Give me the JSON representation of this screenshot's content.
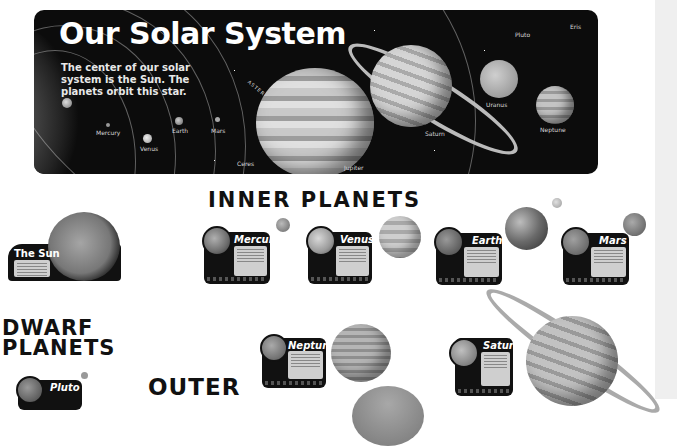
{
  "banner": {
    "title": "Our Solar System",
    "subtitle": "The center of our solar system is the Sun. The planets orbit this star.",
    "labels": {
      "mercury": "Mercury",
      "venus": "Venus",
      "earth": "Earth",
      "mars": "Mars",
      "asteroids": "ASTEROIDS",
      "ceres": "Ceres",
      "jupiter": "Jupiter",
      "saturn": "Saturn",
      "uranus": "Uranus",
      "neptune": "Neptune",
      "pluto": "Pluto",
      "eris": "Eris"
    }
  },
  "headings": {
    "inner": "INNER PLANETS",
    "dwarf_line1": "DWARF",
    "dwarf_line2": "PLANETS",
    "outer": "OUTER"
  },
  "cards": {
    "sun": "The Sun",
    "mercury": "Mercury",
    "venus": "Venus",
    "earth": "Earth",
    "mars": "Mars",
    "neptune": "Neptune",
    "saturn": "Saturn",
    "pluto": "Pluto"
  },
  "colors": {
    "banner_bg": "#0c0c0c",
    "heading": "#111111",
    "card_bg": "#111111",
    "page_bg": "#ffffff",
    "side_strip": "#efefef"
  }
}
